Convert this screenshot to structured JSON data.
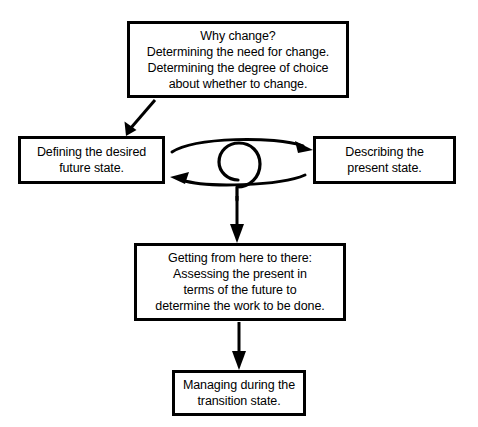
{
  "diagram": {
    "background_color": "#ffffff",
    "stroke_color": "#000000",
    "nodes": {
      "why_change": {
        "label": "Why change?\nDetermining the need for change.\nDetermining the degree of choice\nabout whether to change."
      },
      "future_state": {
        "label": "Defining the desired\nfuture state."
      },
      "present_state": {
        "label": "Describing the\npresent state."
      },
      "getting_there": {
        "label": "Getting from here to there:\nAssessing the present in\nterms of the future to\ndetermine the work to be done."
      },
      "transition": {
        "label": "Managing during the\ntransition state."
      }
    },
    "connectors": [
      {
        "name": "why-change-to-future-state",
        "kind": "diagonal-arrow",
        "from": "why_change",
        "to": "future_state"
      },
      {
        "name": "future-state-to-present-state",
        "kind": "curved-arrow",
        "from": "future_state",
        "to": "present_state"
      },
      {
        "name": "present-state-to-future-state",
        "kind": "curved-arrow",
        "from": "present_state",
        "to": "future_state"
      },
      {
        "name": "spiral",
        "kind": "spiral-coil",
        "from": "iteration-loop",
        "to": "getting_there"
      },
      {
        "name": "spiral-to-getting-there",
        "kind": "straight-arrow",
        "from": "spiral",
        "to": "getting_there"
      },
      {
        "name": "getting-there-to-transition",
        "kind": "straight-arrow",
        "from": "getting_there",
        "to": "transition"
      }
    ]
  }
}
